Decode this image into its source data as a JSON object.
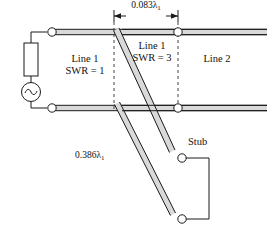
{
  "figure": {
    "colors": {
      "line": "#1a1a1a",
      "conductor_fill": "#d9d9d9",
      "background": "#ffffff",
      "dashed": "#555555"
    },
    "dimension": {
      "label_value": "0.083",
      "label_symbol": "λ",
      "label_subscript": "1",
      "label_full": "0.083λ₁"
    },
    "labels": {
      "line1_left_name": "Line 1",
      "line1_left_swr": "SWR = 1",
      "line1_mid_name": "Line 1",
      "line1_mid_swr": "SWR = 3",
      "line2_name": "Line 2",
      "stub": "Stub",
      "stub_length_value": "0.386",
      "stub_length_symbol": "λ",
      "stub_length_subscript": "1",
      "stub_length_full": "0.386λ₁"
    },
    "components": {
      "resistor": "resistor",
      "source": "ac-source",
      "source_glyph": "∿"
    },
    "terminals": {
      "count": 6,
      "names": [
        "source-top-terminal",
        "source-bottom-terminal",
        "line2-top-terminal",
        "line2-bottom-terminal",
        "stub-top-terminal",
        "stub-bottom-terminal"
      ]
    }
  }
}
